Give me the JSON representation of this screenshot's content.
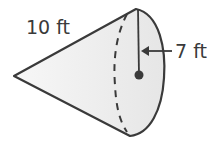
{
  "figure": {
    "type": "cone",
    "labels": {
      "slant_height": "10 ft",
      "radius": "7 ft"
    },
    "colors": {
      "stroke": "#3a3a3a",
      "fill": "#ececec"
    }
  }
}
